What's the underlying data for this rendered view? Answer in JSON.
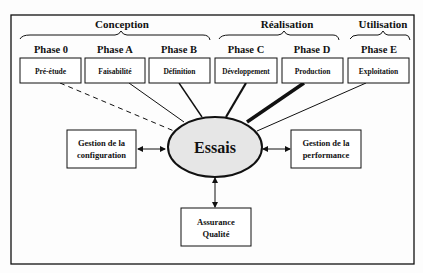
{
  "groups": [
    {
      "label": "Conception"
    },
    {
      "label": "Réalisation"
    },
    {
      "label": "Utilisation"
    }
  ],
  "phases": [
    {
      "title": "Phase 0",
      "box": "Pré-étude",
      "link": "dashed"
    },
    {
      "title": "Phase A",
      "box": "Faisabilité",
      "link": "thin"
    },
    {
      "title": "Phase B",
      "box": "Définition",
      "link": "medium"
    },
    {
      "title": "Phase C",
      "box": "Développement",
      "link": "thick"
    },
    {
      "title": "Phase D",
      "box": "Production",
      "link": "thickest"
    },
    {
      "title": "Phase E",
      "box": "Exploitation",
      "link": "thin"
    }
  ],
  "center": {
    "label": "Essais",
    "fill": "#e6e6e6"
  },
  "side_boxes": {
    "left": {
      "line1": "Gestion de la",
      "line2": "configuration"
    },
    "right": {
      "line1": "Gestion de la",
      "line2": "performance"
    },
    "bottom": {
      "line1": "Assurance",
      "line2": "Qualité"
    }
  }
}
